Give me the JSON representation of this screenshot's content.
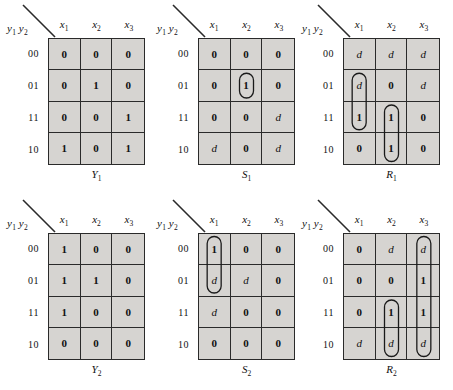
{
  "figure": {
    "axis_label": "y1 y2",
    "col_headers": [
      "x1",
      "x2",
      "x3"
    ],
    "row_headers": [
      "00",
      "01",
      "11",
      "10"
    ]
  },
  "chart_data": {
    "type": "table",
    "xlabel": "x1 x2 x3",
    "ylabel": "y1 y2",
    "col_headers": [
      "x1",
      "x2",
      "x3"
    ],
    "row_headers": [
      "00",
      "01",
      "11",
      "10"
    ],
    "maps": [
      {
        "name": "Y1",
        "position": "top-left",
        "rows": [
          [
            "0",
            "0",
            "0"
          ],
          [
            "0",
            "1",
            "0"
          ],
          [
            "0",
            "0",
            "1"
          ],
          [
            "1",
            "0",
            "1"
          ]
        ],
        "groups": []
      },
      {
        "name": "S1",
        "position": "top-center",
        "rows": [
          [
            "0",
            "0",
            "0"
          ],
          [
            "0",
            "1",
            "0"
          ],
          [
            "0",
            "0",
            "d"
          ],
          [
            "d",
            "0",
            "d"
          ]
        ],
        "groups": [
          {
            "col": 1,
            "row_start": 1,
            "row_end": 1
          }
        ]
      },
      {
        "name": "R1",
        "position": "top-right",
        "rows": [
          [
            "d",
            "d",
            "d"
          ],
          [
            "d",
            "0",
            "d"
          ],
          [
            "1",
            "1",
            "0"
          ],
          [
            "0",
            "1",
            "0"
          ]
        ],
        "groups": [
          {
            "col": 0,
            "row_start": 1,
            "row_end": 2
          },
          {
            "col": 1,
            "row_start": 2,
            "row_end": 3
          }
        ]
      },
      {
        "name": "Y2",
        "position": "bottom-left",
        "rows": [
          [
            "1",
            "0",
            "0"
          ],
          [
            "1",
            "1",
            "0"
          ],
          [
            "1",
            "0",
            "0"
          ],
          [
            "0",
            "0",
            "0"
          ]
        ],
        "groups": []
      },
      {
        "name": "S2",
        "position": "bottom-center",
        "rows": [
          [
            "1",
            "0",
            "0"
          ],
          [
            "d",
            "d",
            "0"
          ],
          [
            "d",
            "0",
            "0"
          ],
          [
            "0",
            "0",
            "0"
          ]
        ],
        "groups": [
          {
            "col": 0,
            "row_start": 0,
            "row_end": 1
          }
        ]
      },
      {
        "name": "R2",
        "position": "bottom-right",
        "rows": [
          [
            "0",
            "d",
            "d"
          ],
          [
            "0",
            "0",
            "1"
          ],
          [
            "0",
            "1",
            "1"
          ],
          [
            "d",
            "d",
            "d"
          ]
        ],
        "groups": [
          {
            "col": 2,
            "row_start": 0,
            "row_end": 3
          },
          {
            "col": 1,
            "row_start": 2,
            "row_end": 3
          }
        ]
      }
    ]
  },
  "colors": {
    "cell_fill": "#d6d4d1",
    "grid_line": "#2a2a2a",
    "text": "#111111",
    "page_background": "#ffffff"
  }
}
